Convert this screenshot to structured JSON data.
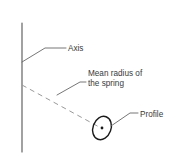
{
  "diagram": {
    "type": "technical-line-drawing",
    "background_color": "#ffffff",
    "line_color": "#555555",
    "dashed_line_color": "#9a9a9a",
    "text_color": "#3a3a3a",
    "profile_outline_color": "#1a1a1a",
    "elements": {
      "axis_line": {
        "name": "axis",
        "style": "solid",
        "orientation": "vertical",
        "x": 22,
        "y_top": 23,
        "y_bottom": 152
      },
      "mean_radius_line": {
        "name": "mean radius of the spring",
        "style": "dashed",
        "from_x": 22,
        "from_y": 85,
        "to_x": 101,
        "to_y": 128
      },
      "profile_ellipse": {
        "name": "profile",
        "center_x": 102,
        "center_y": 128,
        "radius_x": 9,
        "radius_y": 12,
        "rotation_deg": 20,
        "has_center_dot": true
      }
    }
  },
  "callouts": [
    {
      "id": "axis",
      "label": "Axis",
      "text_x": 68,
      "text_y": 51,
      "leader": "M22,62 L45,48 L66,48"
    },
    {
      "id": "mean-radius",
      "label_line_1": "Mean radius of",
      "label_line_2": "the spring",
      "text_x": 88,
      "text_y_1": 76,
      "text_y_2": 86,
      "leader": "M57,95 L80,82 L86,82"
    },
    {
      "id": "profile",
      "label": "Profile",
      "text_x": 140,
      "text_y": 117,
      "leader": "M111,126 L130,113 L138,113"
    }
  ]
}
